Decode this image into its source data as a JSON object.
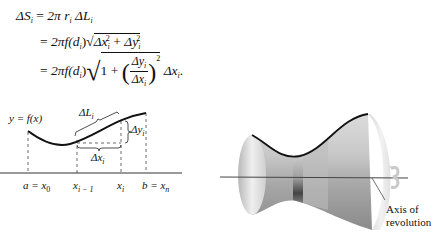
{
  "equations": {
    "line1": {
      "lhs": "ΔS",
      "lhs_sub": "i",
      "eq": "=",
      "rhs_a": "2π r",
      "rhs_a_sub": "i",
      "rhs_b": " ΔL",
      "rhs_b_sub": "i"
    },
    "line2": {
      "eq": "=",
      "prefix": "2πf(d",
      "prefix_sub": "i",
      "prefix_close": ")",
      "term1": "Δx",
      "term1_sub": "i",
      "term1_sup": "2",
      "plus": " + ",
      "term2": "Δy",
      "term2_sub": "i",
      "term2_sup": "2"
    },
    "line3": {
      "eq": "=",
      "prefix": "2πf(d",
      "prefix_sub": "i",
      "prefix_close": ")",
      "one": "1",
      "plus": " + ",
      "num": "Δy",
      "num_sub": "i",
      "den": "Δx",
      "den_sub": "i",
      "sup": "2",
      "tail": "Δx",
      "tail_sub": "i",
      "end": "."
    }
  },
  "left_figure": {
    "curve_label": "y = f(x)",
    "arc_label": "ΔL",
    "arc_label_sub": "i",
    "dy_label": "Δy",
    "dy_label_sub": "i",
    "dx_label": "Δx",
    "dx_label_sub": "i",
    "ticks": [
      {
        "label": "a = x",
        "sub": "0"
      },
      {
        "label": "x",
        "sub": "i − 1"
      },
      {
        "label": "x",
        "sub": "i"
      },
      {
        "label": "b = x",
        "sub": "n"
      }
    ]
  },
  "right_figure": {
    "axis_label_line1": "Axis of",
    "axis_label_line2": "revolution",
    "rotation_icon": "rotation-arrow-icon"
  },
  "colors": {
    "ink": "#111111",
    "surface_light": "#e8e8e8",
    "surface_mid": "#bdbdbd",
    "surface_dark": "#5a5a5a"
  }
}
